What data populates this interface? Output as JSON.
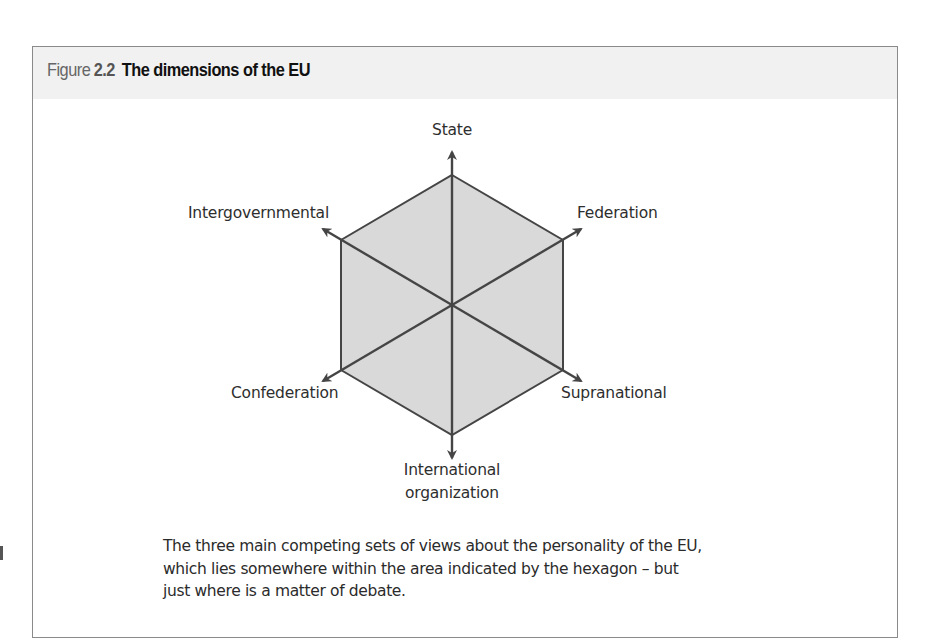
{
  "figure": {
    "label_word": "Figure",
    "number": "2.2",
    "title": "The dimensions of the EU"
  },
  "diagram": {
    "shape": "hexagon",
    "colors": {
      "hexagon_fill": "#d9d9d9",
      "line": "#454545",
      "header_band": "#f1f1f1",
      "border": "#8a8a8a"
    },
    "axes": [
      {
        "from": "International organization",
        "to": "State"
      },
      {
        "from": "Confederation",
        "to": "Federation"
      },
      {
        "from": "Intergovernmental",
        "to": "Supranational"
      }
    ],
    "labels": {
      "top": "State",
      "upper_right": "Federation",
      "upper_left": "Intergovernmental",
      "lower_left": "Confederation",
      "lower_right": "Supranational",
      "bottom_line1": "International",
      "bottom_line2": "organization"
    }
  },
  "caption": {
    "line1": "The three main competing sets of views about the personality of the EU,",
    "line2": "which lies somewhere within the area indicated by the hexagon – but",
    "line3": "just where is a matter of debate."
  }
}
